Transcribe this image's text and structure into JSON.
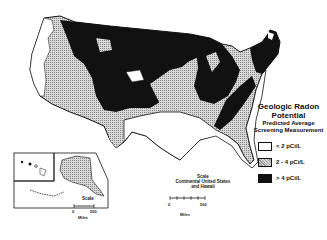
{
  "legend": {
    "title_line1": "Geologic Radon",
    "title_line2": "Potential",
    "subtitle_line1": "Predicted Average",
    "subtitle_line2": "Screening Measurement",
    "items": [
      {
        "label": "< 2 pCi/L",
        "fill": "#ffffff",
        "category": "low"
      },
      {
        "label": "2 - 4 pCi/L",
        "fill": "#bbbbbb",
        "category": "moderate"
      },
      {
        "label": "> 4 pCi/L",
        "fill": "#111111",
        "category": "high"
      }
    ]
  },
  "scale_main": {
    "line1": "Scale",
    "line2": "Continental United States",
    "line3": "and Hawaii",
    "start": "0",
    "end": "500",
    "units": "Miles"
  },
  "scale_alaska": {
    "title": "Scale",
    "start": "0",
    "end": "500",
    "units": "Miles"
  },
  "insets": [
    "Hawaii",
    "Alaska"
  ]
}
